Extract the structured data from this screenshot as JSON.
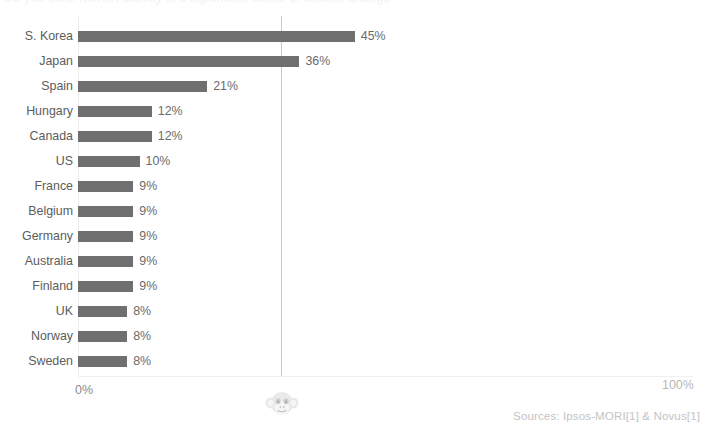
{
  "title": {
    "text": "Do you think human activity is a significant cause of climate change?"
  },
  "sources": {
    "text": "Sources: Ipsos-MORI[1] & Novus[1]"
  },
  "axis": {
    "min_label": "0%",
    "max_label": "100%"
  },
  "watermark": {
    "icon": "monkey-face-icon"
  },
  "colors": {
    "bar": "#6f6f6f",
    "gridline": "#c9c9c9",
    "label": "#5c5c5c",
    "value": "#6b6b6b",
    "axis_label": "#8a8a8a",
    "background": "#ffffff"
  },
  "chart_data": {
    "type": "bar",
    "orientation": "horizontal",
    "title": "",
    "xlabel": "",
    "ylabel": "",
    "xlim": [
      0,
      100
    ],
    "grid": true,
    "gridlines": [
      33
    ],
    "legend": null,
    "categories": [
      "S. Korea",
      "Japan",
      "Spain",
      "Hungary",
      "Canada",
      "US",
      "France",
      "Belgium",
      "Germany",
      "Australia",
      "Finland",
      "UK",
      "Norway",
      "Sweden"
    ],
    "values": [
      45,
      36,
      21,
      12,
      12,
      10,
      9,
      9,
      9,
      9,
      9,
      8,
      8,
      8
    ],
    "value_labels": [
      "45%",
      "36%",
      "21%",
      "12%",
      "12%",
      "10%",
      "9%",
      "9%",
      "9%",
      "9%",
      "9%",
      "8%",
      "8%",
      "8%"
    ],
    "tick_labels": [
      "0%",
      "100%"
    ]
  }
}
